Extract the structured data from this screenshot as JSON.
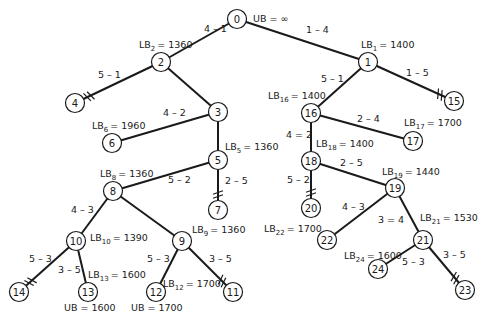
{
  "diagram": {
    "root_bound": {
      "text": "UB = ∞",
      "x": 253,
      "y": 22
    },
    "nodes": [
      {
        "id": "0",
        "x": 237,
        "y": 19
      },
      {
        "id": "1",
        "x": 368,
        "y": 62
      },
      {
        "id": "2",
        "x": 161,
        "y": 62
      },
      {
        "id": "3",
        "x": 218,
        "y": 112
      },
      {
        "id": "4",
        "x": 75,
        "y": 103
      },
      {
        "id": "5",
        "x": 218,
        "y": 160
      },
      {
        "id": "6",
        "x": 112,
        "y": 143
      },
      {
        "id": "7",
        "x": 218,
        "y": 210
      },
      {
        "id": "8",
        "x": 113,
        "y": 191
      },
      {
        "id": "9",
        "x": 182,
        "y": 241
      },
      {
        "id": "10",
        "x": 76,
        "y": 241
      },
      {
        "id": "11",
        "x": 233,
        "y": 292
      },
      {
        "id": "12",
        "x": 156,
        "y": 292
      },
      {
        "id": "13",
        "x": 88,
        "y": 292
      },
      {
        "id": "14",
        "x": 19,
        "y": 292
      },
      {
        "id": "15",
        "x": 454,
        "y": 101
      },
      {
        "id": "16",
        "x": 311,
        "y": 113
      },
      {
        "id": "17",
        "x": 413,
        "y": 141
      },
      {
        "id": "18",
        "x": 311,
        "y": 161
      },
      {
        "id": "19",
        "x": 395,
        "y": 188
      },
      {
        "id": "20",
        "x": 311,
        "y": 208
      },
      {
        "id": "21",
        "x": 423,
        "y": 240
      },
      {
        "id": "22",
        "x": 327,
        "y": 240
      },
      {
        "id": "23",
        "x": 465,
        "y": 290
      },
      {
        "id": "24",
        "x": 378,
        "y": 269
      }
    ],
    "edges": [
      {
        "from": "0",
        "to": "2",
        "label": "4 – 1",
        "lx": 204,
        "ly": 32,
        "cut": false
      },
      {
        "from": "0",
        "to": "1",
        "label": "1 – 4",
        "lx": 306,
        "ly": 33,
        "cut": false
      },
      {
        "from": "2",
        "to": "4",
        "label": "5 – 1",
        "lx": 98,
        "ly": 78,
        "cut": true
      },
      {
        "from": "2",
        "to": "3",
        "label": "",
        "lx": 0,
        "ly": 0,
        "cut": false
      },
      {
        "from": "3",
        "to": "6",
        "label": "4 – 2",
        "lx": 163,
        "ly": 116,
        "cut": false
      },
      {
        "from": "3",
        "to": "5",
        "label": "",
        "lx": 0,
        "ly": 0,
        "cut": false
      },
      {
        "from": "5",
        "to": "8",
        "label": "5 – 2",
        "lx": 168,
        "ly": 183,
        "cut": false
      },
      {
        "from": "5",
        "to": "7",
        "label": "2 – 5",
        "lx": 225,
        "ly": 184,
        "cut": true
      },
      {
        "from": "8",
        "to": "10",
        "label": "4 – 3",
        "lx": 71,
        "ly": 213,
        "cut": false
      },
      {
        "from": "8",
        "to": "9",
        "label": "",
        "lx": 0,
        "ly": 0,
        "cut": false
      },
      {
        "from": "10",
        "to": "14",
        "label": "5 – 3",
        "lx": 29,
        "ly": 262,
        "cut": true
      },
      {
        "from": "10",
        "to": "13",
        "label": "3 – 5",
        "lx": 58,
        "ly": 273,
        "cut": false
      },
      {
        "from": "9",
        "to": "12",
        "label": "5 – 3",
        "lx": 147,
        "ly": 262,
        "cut": false
      },
      {
        "from": "9",
        "to": "11",
        "label": "3 – 5",
        "lx": 209,
        "ly": 262,
        "cut": true
      },
      {
        "from": "1",
        "to": "16",
        "label": "5 – 1",
        "lx": 321,
        "ly": 82,
        "cut": false
      },
      {
        "from": "1",
        "to": "15",
        "label": "1 – 5",
        "lx": 406,
        "ly": 76,
        "cut": true
      },
      {
        "from": "16",
        "to": "17",
        "label": "2 – 4",
        "lx": 357,
        "ly": 122,
        "cut": false
      },
      {
        "from": "16",
        "to": "18",
        "label": "4 = 2",
        "lx": 286,
        "ly": 138,
        "cut": false
      },
      {
        "from": "18",
        "to": "19",
        "label": "2 – 5",
        "lx": 340,
        "ly": 166,
        "cut": false
      },
      {
        "from": "18",
        "to": "20",
        "label": "5 – 2",
        "lx": 287,
        "ly": 183,
        "cut": true
      },
      {
        "from": "19",
        "to": "22",
        "label": "4 – 3",
        "lx": 342,
        "ly": 210,
        "cut": false
      },
      {
        "from": "19",
        "to": "21",
        "label": "3 = 4",
        "lx": 378,
        "ly": 223,
        "cut": false
      },
      {
        "from": "21",
        "to": "24",
        "label": "5 – 3",
        "lx": 402,
        "ly": 265,
        "cut": false
      },
      {
        "from": "21",
        "to": "23",
        "label": "3 – 5",
        "lx": 443,
        "ly": 258,
        "cut": true
      }
    ],
    "bounds": [
      {
        "node": "1",
        "prefix": "LB",
        "sub": "1",
        "value": "= 1400",
        "x": 361,
        "y": 48
      },
      {
        "node": "2",
        "prefix": "LB",
        "sub": "2",
        "value": "= 1360",
        "x": 139,
        "y": 48
      },
      {
        "node": "5",
        "prefix": "LB",
        "sub": "5",
        "value": "= 1360",
        "x": 225,
        "y": 150
      },
      {
        "node": "6",
        "prefix": "LB",
        "sub": "6",
        "value": "= 1960",
        "x": 92,
        "y": 129
      },
      {
        "node": "8",
        "prefix": "LB",
        "sub": "8",
        "value": "= 1360",
        "x": 100,
        "y": 177
      },
      {
        "node": "9",
        "prefix": "LB",
        "sub": "9",
        "value": "= 1360",
        "x": 192,
        "y": 233
      },
      {
        "node": "10",
        "prefix": "LB",
        "sub": "10",
        "value": "= 1390",
        "x": 90,
        "y": 241
      },
      {
        "node": "12",
        "prefix": "LB",
        "sub": "12",
        "value": "= 1700",
        "x": 163,
        "y": 287
      },
      {
        "node": "13",
        "prefix": "LB",
        "sub": "13",
        "value": "= 1600",
        "x": 88,
        "y": 278
      },
      {
        "node": "16",
        "prefix": "LB",
        "sub": "16",
        "value": "= 1400",
        "x": 268,
        "y": 99
      },
      {
        "node": "17",
        "prefix": "LB",
        "sub": "17",
        "value": "= 1700",
        "x": 404,
        "y": 126
      },
      {
        "node": "18",
        "prefix": "LB",
        "sub": "18",
        "value": "= 1400",
        "x": 316,
        "y": 147
      },
      {
        "node": "19",
        "prefix": "LB",
        "sub": "19",
        "value": "= 1440",
        "x": 382,
        "y": 175
      },
      {
        "node": "21",
        "prefix": "LB",
        "sub": "21",
        "value": "= 1530",
        "x": 420,
        "y": 221
      },
      {
        "node": "22",
        "prefix": "LB",
        "sub": "22",
        "value": "= 1700",
        "x": 264,
        "y": 232
      },
      {
        "node": "24",
        "prefix": "LB",
        "sub": "24",
        "value": "= 1600",
        "x": 344,
        "y": 259
      }
    ],
    "upper_bounds": [
      {
        "node": "13",
        "text": "UB = 1600",
        "x": 64,
        "y": 311
      },
      {
        "node": "12",
        "text": "UB = 1700",
        "x": 131,
        "y": 311
      }
    ],
    "colors": {
      "stroke": "#1a1a1a",
      "background": "#ffffff",
      "node_fill": "#ffffff"
    }
  }
}
